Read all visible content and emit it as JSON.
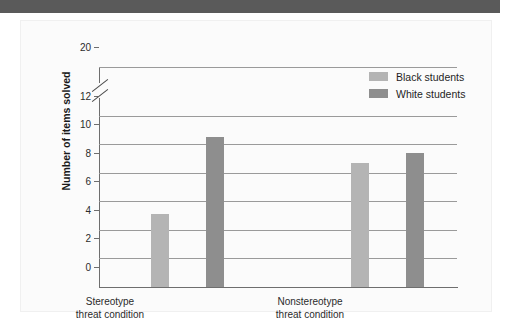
{
  "figure": {
    "header_band_color": "#5a5a5a",
    "panel_background": "#fbfbfb"
  },
  "legend": {
    "position": "top-right",
    "entries": [
      {
        "label": "Black students",
        "color": "#b4b4b4",
        "swatch_name": "legend-swatch-black-students"
      },
      {
        "label": "White students",
        "color": "#8e8e8e",
        "swatch_name": "legend-swatch-white-students"
      }
    ]
  },
  "axes": {
    "ylabel": "Number of items solved",
    "yticks": [
      "0",
      "2",
      "4",
      "6",
      "8",
      "10",
      "12",
      "20"
    ],
    "axis_break": {
      "between": [
        "12",
        "20"
      ],
      "style": "double-slash"
    },
    "xgroups": [
      {
        "line1": "Stereotype",
        "line2": "threat condition"
      },
      {
        "line1": "Nonstereotype",
        "line2": "threat condition"
      }
    ]
  },
  "chart_data": {
    "type": "bar",
    "title": "",
    "subtitle": "",
    "xlabel": "",
    "ylabel": "Number of items solved",
    "categories": [
      "Stereotype threat condition",
      "Nonstereotype threat condition"
    ],
    "series": [
      {
        "name": "Black students",
        "color": "#b4b4b4",
        "values": [
          5.1,
          8.7
        ]
      },
      {
        "name": "White students",
        "color": "#8e8e8e",
        "values": [
          10.5,
          9.4
        ]
      }
    ],
    "ylim": [
      0,
      20
    ],
    "ytick_values": [
      0,
      2,
      4,
      6,
      8,
      10,
      12,
      20
    ],
    "axis_break": {
      "lower": 12,
      "upper": 20
    },
    "grid": true,
    "grid_axis": "y",
    "legend_position": "top right",
    "annotations": []
  }
}
